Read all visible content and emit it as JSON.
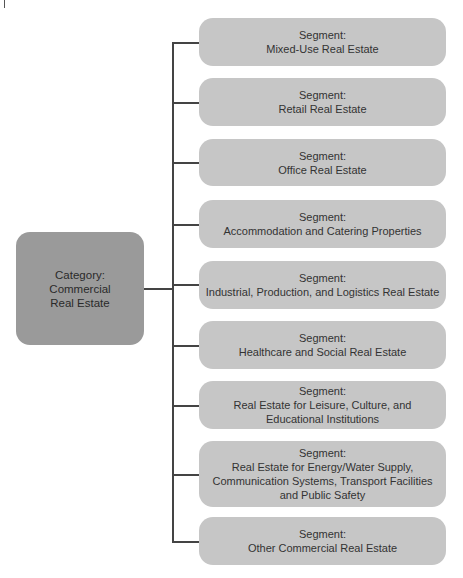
{
  "diagram": {
    "category": {
      "label": "Category:",
      "name_line1": "Commercial",
      "name_line2": "Real Estate"
    },
    "segments": [
      {
        "label": "Segment:",
        "lines": [
          "Mixed-Use Real Estate"
        ]
      },
      {
        "label": "Segment:",
        "lines": [
          "Retail Real Estate"
        ]
      },
      {
        "label": "Segment:",
        "lines": [
          "Office Real Estate"
        ]
      },
      {
        "label": "Segment:",
        "lines": [
          "Accommodation and Catering Properties"
        ]
      },
      {
        "label": "Segment:",
        "lines": [
          "Industrial, Production, and Logistics Real Estate"
        ]
      },
      {
        "label": "Segment:",
        "lines": [
          "Healthcare and Social Real Estate"
        ]
      },
      {
        "label": "Segment:",
        "lines": [
          "Real Estate for Leisure, Culture, and",
          "Educational Institutions"
        ]
      },
      {
        "label": "Segment:",
        "lines": [
          "Real Estate for Energy/Water Supply,",
          "Communication Systems, Transport Facilities",
          "and Public Safety"
        ]
      },
      {
        "label": "Segment:",
        "lines": [
          "Other Commercial Real Estate"
        ]
      }
    ],
    "colors": {
      "segment_fill": "#c6c6c6",
      "category_fill": "#9a9a9a",
      "connector": "#444444"
    }
  }
}
